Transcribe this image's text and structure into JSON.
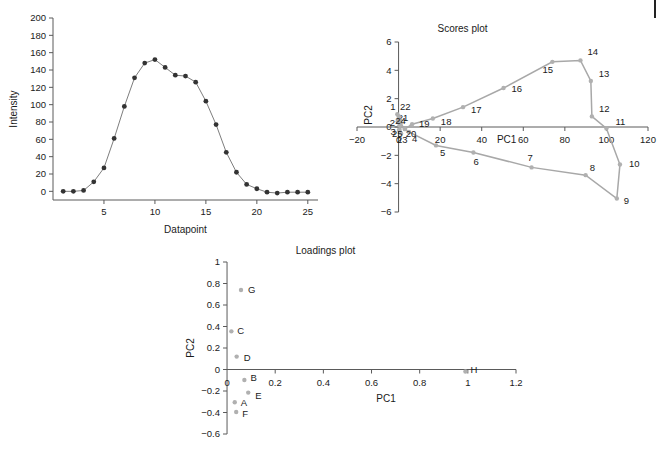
{
  "page": {
    "background": "#ffffff",
    "corner_mark_color": "#222222"
  },
  "chart_data": [
    {
      "id": "intensity-profile",
      "type": "line",
      "title": "",
      "xlabel": "Datapoint",
      "ylabel": "Intensity",
      "xlim": [
        0,
        26
      ],
      "ylim": [
        -10,
        200
      ],
      "xticks": [
        5,
        10,
        15,
        20,
        25
      ],
      "yticks": [
        0,
        20,
        40,
        60,
        80,
        100,
        120,
        140,
        160,
        180,
        200
      ],
      "grid": false,
      "legend": "none",
      "marker": "filled-circle",
      "color": "#333333",
      "x": [
        1,
        2,
        3,
        4,
        5,
        6,
        7,
        8,
        9,
        10,
        11,
        12,
        13,
        14,
        15,
        16,
        17,
        18,
        19,
        20,
        21,
        22,
        23,
        24,
        25
      ],
      "values": [
        0,
        0,
        1,
        11,
        27,
        61,
        98,
        131,
        148,
        152,
        143,
        134,
        133,
        126,
        104,
        77,
        45,
        22,
        8,
        3,
        -1,
        -2,
        -1,
        -1,
        -1
      ]
    },
    {
      "id": "scores-plot",
      "type": "scatter",
      "title": "Scores plot",
      "xlabel": "PC1",
      "ylabel": "PC2",
      "xlim": [
        -20,
        120
      ],
      "ylim": [
        -6,
        6
      ],
      "xticks": [
        -20,
        0,
        20,
        40,
        60,
        80,
        100,
        120
      ],
      "yticks": [
        -6,
        -4,
        -2,
        0,
        2,
        4,
        6
      ],
      "grid": false,
      "legend": "none",
      "connected": true,
      "color": "#b0b0b0",
      "points": [
        {
          "label": "1",
          "x": -0.6,
          "y": 0.9
        },
        {
          "label": "2",
          "x": -0.4,
          "y": 0.4
        },
        {
          "label": "3",
          "x": 0.4,
          "y": 0.1
        },
        {
          "label": "4",
          "x": 5.0,
          "y": -0.35
        },
        {
          "label": "5",
          "x": 18.0,
          "y": -1.3
        },
        {
          "label": "6",
          "x": 36.0,
          "y": -1.8
        },
        {
          "label": "7",
          "x": 64.0,
          "y": -2.85
        },
        {
          "label": "8",
          "x": 90.0,
          "y": -3.4
        },
        {
          "label": "9",
          "x": 105.0,
          "y": -5.05
        },
        {
          "label": "10",
          "x": 106.5,
          "y": -2.65
        },
        {
          "label": "11",
          "x": 100.0,
          "y": -0.1
        },
        {
          "label": "12",
          "x": 93.0,
          "y": 0.75
        },
        {
          "label": "13",
          "x": 92.5,
          "y": 3.25
        },
        {
          "label": "14",
          "x": 87.5,
          "y": 4.7
        },
        {
          "label": "15",
          "x": 74.0,
          "y": 4.6
        },
        {
          "label": "16",
          "x": 50.5,
          "y": 2.75
        },
        {
          "label": "17",
          "x": 31.0,
          "y": 1.4
        },
        {
          "label": "18",
          "x": 16.5,
          "y": 0.6
        },
        {
          "label": "19",
          "x": 6.5,
          "y": 0.2
        },
        {
          "label": "20",
          "x": 3.0,
          "y": -0.15
        },
        {
          "label": "21",
          "x": 1.0,
          "y": 0.25
        },
        {
          "label": "22",
          "x": 0.2,
          "y": 0.75
        },
        {
          "label": "23",
          "x": 1.2,
          "y": -0.45
        },
        {
          "label": "24",
          "x": 0.8,
          "y": 0.45
        },
        {
          "label": "25",
          "x": 0.2,
          "y": -0.2
        }
      ]
    },
    {
      "id": "loadings-plot",
      "type": "scatter",
      "title": "Loadings plot",
      "xlabel": "PC1",
      "ylabel": "PC2",
      "xlim": [
        -0.05,
        1.2
      ],
      "ylim": [
        -0.6,
        1
      ],
      "xticks": [
        0,
        0.2,
        0.4,
        0.6,
        0.8,
        1,
        1.2
      ],
      "xticklabels": [
        "0",
        "0.2",
        "0.4",
        "0.6",
        "0.8",
        "1",
        "1.2"
      ],
      "yticks": [
        -0.6,
        -0.4,
        -0.2,
        0,
        0.2,
        0.4,
        0.6,
        0.8,
        1
      ],
      "yticklabels": [
        "-0.6",
        "-0.4",
        "-0.2",
        "0",
        "0.2",
        "0.4",
        "0.6",
        "0.8",
        "1"
      ],
      "grid": false,
      "legend": "none",
      "color": "#a0a0a0",
      "points": [
        {
          "label": "A",
          "x": 0.032,
          "y": -0.305
        },
        {
          "label": "B",
          "x": 0.072,
          "y": -0.098
        },
        {
          "label": "C",
          "x": 0.018,
          "y": 0.355
        },
        {
          "label": "D",
          "x": 0.04,
          "y": 0.12
        },
        {
          "label": "E",
          "x": 0.088,
          "y": -0.215
        },
        {
          "label": "F",
          "x": 0.038,
          "y": -0.395
        },
        {
          "label": "G",
          "x": 0.058,
          "y": 0.74
        },
        {
          "label": "H",
          "x": 0.99,
          "y": -0.018
        }
      ]
    }
  ]
}
